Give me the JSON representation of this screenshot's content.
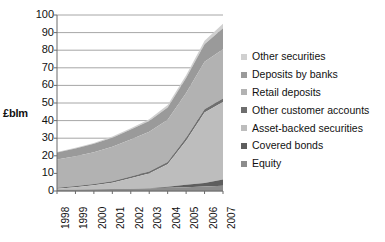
{
  "chart_data": {
    "type": "area",
    "stacked": true,
    "title": "",
    "subtitle": "",
    "xlabel": "",
    "ylabel": "£blm",
    "categories": [
      "1998",
      "1999",
      "2000",
      "2001",
      "2002",
      "2003",
      "2004",
      "2005",
      "2006",
      "2007"
    ],
    "x": [
      1998,
      1999,
      2000,
      2001,
      2002,
      2003,
      2004,
      2005,
      2006,
      2007
    ],
    "ylim": [
      0,
      100
    ],
    "yticks": [
      0,
      10,
      20,
      30,
      40,
      50,
      60,
      70,
      80,
      90,
      100
    ],
    "ytick_labels": [
      "0",
      "10",
      "20",
      "30",
      "40",
      "50",
      "60",
      "70",
      "80",
      "90",
      "100"
    ],
    "grid": true,
    "grid_axis": "y",
    "legend_position": "right",
    "series": [
      {
        "name": "Equity",
        "color": "#8c8c8c",
        "values": [
          0.8,
          0.9,
          1.0,
          1.1,
          1.3,
          1.5,
          1.8,
          2.2,
          2.6,
          3.0
        ]
      },
      {
        "name": "Covered bonds",
        "color": "#5e5e5e",
        "values": [
          0.0,
          0.0,
          0.0,
          0.0,
          0.0,
          0.0,
          0.6,
          1.4,
          2.0,
          3.5
        ]
      },
      {
        "name": "Asset-backed securities",
        "color": "#bdbdbd",
        "values": [
          0.5,
          1.2,
          2.2,
          3.6,
          6.0,
          8.5,
          12.8,
          25.0,
          40.0,
          44.0
        ]
      },
      {
        "name": "Other customer accounts",
        "color": "#6e6e6e",
        "values": [
          0.6,
          0.7,
          0.8,
          0.9,
          1.0,
          1.1,
          1.3,
          1.6,
          1.8,
          2.0
        ]
      },
      {
        "name": "Retail deposits",
        "color": "#b2b2b2",
        "values": [
          16.0,
          17.0,
          18.0,
          19.5,
          21.0,
          22.5,
          24.0,
          25.5,
          27.0,
          28.0
        ]
      },
      {
        "name": "Deposits by banks",
        "color": "#9a9a9a",
        "values": [
          4.0,
          4.4,
          4.8,
          5.2,
          5.6,
          6.2,
          7.0,
          8.5,
          10.0,
          12.0
        ]
      },
      {
        "name": "Other securities",
        "color": "#d0d0d0",
        "values": [
          0.3,
          0.4,
          0.5,
          0.6,
          0.8,
          1.0,
          1.3,
          1.6,
          2.0,
          2.5
        ]
      }
    ],
    "totals": [
      22.2,
      24.6,
      27.3,
      30.9,
      35.7,
      40.8,
      48.8,
      65.8,
      85.4,
      95.0
    ],
    "legend_entries": [
      {
        "label": "Other securities",
        "color": "#d0d0d0"
      },
      {
        "label": "Deposits by banks",
        "color": "#9a9a9a"
      },
      {
        "label": "Retail deposits",
        "color": "#b2b2b2"
      },
      {
        "label": "Other customer accounts",
        "color": "#6e6e6e"
      },
      {
        "label": "Asset-backed securities",
        "color": "#bdbdbd"
      },
      {
        "label": "Covered bonds",
        "color": "#5e5e5e"
      },
      {
        "label": "Equity",
        "color": "#8c8c8c"
      }
    ]
  },
  "axes": {
    "y_title": "£blm",
    "y_tick_labels": [
      "100",
      "90",
      "80",
      "70",
      "60",
      "50",
      "40",
      "30",
      "20",
      "10",
      "0"
    ],
    "x_tick_labels": [
      "1998",
      "1999",
      "2000",
      "2001",
      "2002",
      "2003",
      "2004",
      "2005",
      "2006",
      "2007"
    ]
  },
  "colors": {
    "background": "#ffffff",
    "axis_line": "#6b6b6b",
    "grid_line": "#8f8f8f",
    "text": "#111111"
  }
}
